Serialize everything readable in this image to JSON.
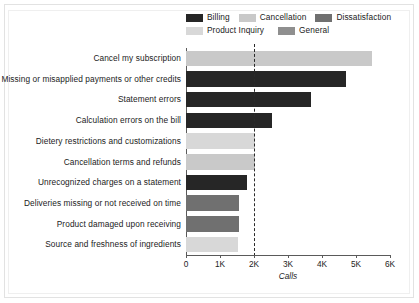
{
  "chart_data": {
    "type": "bar",
    "orientation": "horizontal",
    "title": "",
    "xlabel": "Calls",
    "ylabel": "",
    "xlim": [
      0,
      6000
    ],
    "xticks": [
      0,
      1000,
      2000,
      3000,
      4000,
      5000,
      6000
    ],
    "xticklabels": [
      "0",
      "1K",
      "2K",
      "3K",
      "4K",
      "5K",
      "6K"
    ],
    "grid": false,
    "legend_position": "top-right",
    "reference_line": {
      "value": 2000,
      "style": "dashed",
      "color": "#2a2a2a"
    },
    "categories": [
      "Cancel my subscription",
      "Missing or misapplied payments or other credits",
      "Statement errors",
      "Calculation errors on the bill",
      "Dietery restrictions and customizations",
      "Cancellation terms and refunds",
      "Unrecognized charges on a statement",
      "Deliveries missing or not received on time",
      "Product damaged upon receiving",
      "Source and freshness of ingredients"
    ],
    "values": [
      5470,
      4700,
      3670,
      2540,
      2040,
      2040,
      1800,
      1560,
      1560,
      1540
    ],
    "point_categories": [
      "Cancellation",
      "Billing",
      "Billing",
      "Billing",
      "Product Inquiry",
      "Cancellation",
      "Billing",
      "Dissatisfaction",
      "Dissatisfaction",
      "Product Inquiry"
    ],
    "legend": [
      {
        "label": "Billing",
        "color": "#262626"
      },
      {
        "label": "Cancellation",
        "color": "#c9c9c9"
      },
      {
        "label": "Dissatisfaction",
        "color": "#707070"
      },
      {
        "label": "Product Inquiry",
        "color": "#d8d8d8"
      },
      {
        "label": "General",
        "color": "#8f8f8f"
      }
    ]
  }
}
